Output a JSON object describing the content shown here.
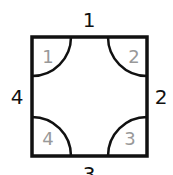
{
  "diagram": {
    "side_labels": {
      "top": "1",
      "right": "2",
      "bottom": "3",
      "left": "4"
    },
    "corner_labels": {
      "top_left": "1",
      "top_right": "2",
      "bottom_right": "3",
      "bottom_left": "4"
    },
    "colors": {
      "stroke": "#111111",
      "corner_text": "#999999",
      "side_text": "#111111"
    }
  }
}
